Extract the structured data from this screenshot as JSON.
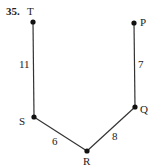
{
  "problem_number": "35.",
  "points": {
    "T": {
      "label": "T",
      "x": 33,
      "y": 22
    },
    "P": {
      "label": "P",
      "x": 134,
      "y": 23
    },
    "S": {
      "label": "S",
      "x": 34,
      "y": 117
    },
    "R": {
      "label": "R",
      "x": 87,
      "y": 151
    },
    "Q": {
      "label": "Q",
      "x": 135,
      "y": 107
    }
  },
  "segments": [
    {
      "from": "T",
      "to": "S",
      "length": "11"
    },
    {
      "from": "S",
      "to": "R",
      "length": "6"
    },
    {
      "from": "R",
      "to": "Q",
      "length": "8"
    },
    {
      "from": "Q",
      "to": "P",
      "length": "7"
    }
  ],
  "colors": {
    "line": "#333333",
    "point": "#111111"
  }
}
